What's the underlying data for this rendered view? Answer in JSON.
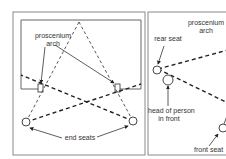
{
  "figure": {
    "panels": [
      {
        "id": "left",
        "description": "Proscenium stage with sightlines from end seats",
        "labels": {
          "arch": "proscenium arch",
          "arch_line1": "proscenium",
          "arch_line2": "arch",
          "seats": "end seats"
        }
      },
      {
        "id": "right",
        "description": "Section view: sightline from rear seat over head of person in front",
        "labels": {
          "arch_line1": "proscenium",
          "arch_line2": "arch",
          "rear_seat": "rear seat",
          "head_line1": "head of person",
          "head_line2": "in front",
          "front_seat": "front seat"
        }
      }
    ],
    "colors": {
      "background": "#ffffff",
      "frame": "#8a8a8a",
      "lines": "#333333"
    }
  }
}
